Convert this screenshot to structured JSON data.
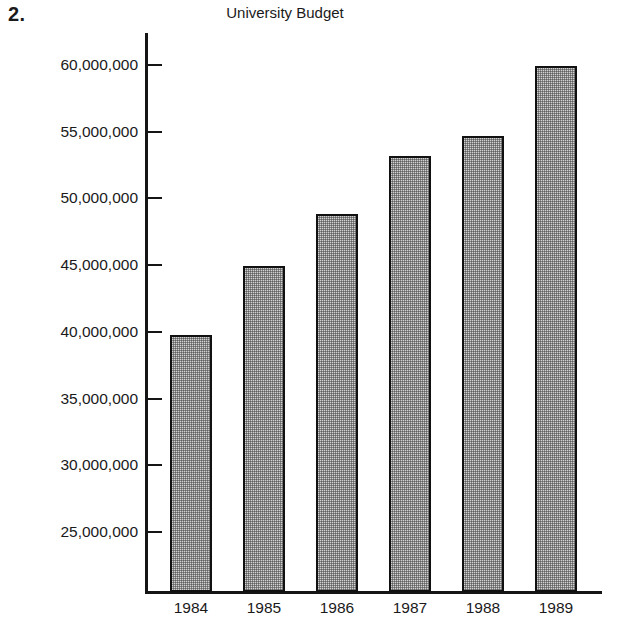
{
  "problem_number": "2.",
  "chart_data": {
    "type": "bar",
    "title": "University Budget",
    "xlabel": "",
    "ylabel": "",
    "categories": [
      "1984",
      "1985",
      "1986",
      "1987",
      "1988",
      "1989"
    ],
    "values": [
      39800000,
      44900000,
      48800000,
      53200000,
      54700000,
      59900000
    ],
    "series": [
      {
        "name": "University Budget",
        "values": [
          39800000,
          44900000,
          48800000,
          53200000,
          54700000,
          59900000
        ]
      }
    ],
    "y_tick_labels": [
      "60,000,000",
      "55,000,000",
      "50,000,000",
      "45,000,000",
      "40,000,000",
      "35,000,000",
      "30,000,000",
      "25,000,000"
    ],
    "y_tick_values": [
      60000000,
      55000000,
      50000000,
      45000000,
      40000000,
      35000000,
      30000000,
      25000000
    ],
    "ylim": [
      20500000,
      62400000
    ],
    "grid": false,
    "legend": "none",
    "bar_fill": "#d2d2d2",
    "bar_border": "#111111",
    "axis_color": "#151515"
  }
}
